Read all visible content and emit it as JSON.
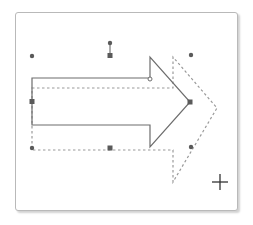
{
  "canvas": {
    "description": "Arrow shape being dragged with selection handles",
    "colors": {
      "frame_border": "#b9b9b9",
      "shape_stroke": "#6d6d6d",
      "preview_stroke": "#9a9a9a",
      "handle_fill": "#5a5a5a",
      "cursor": "#333333"
    }
  },
  "shape": {
    "type": "right-arrow",
    "state": "selected"
  },
  "preview": {
    "type": "right-arrow",
    "style": "dashed"
  },
  "handles": {
    "corner_dots": [
      "top-left",
      "top-right",
      "bottom-left",
      "bottom-right"
    ],
    "side_squares": [
      "top",
      "left",
      "right",
      "bottom"
    ],
    "rotation": "rotate-handle",
    "adjust": "head-adjust-handle"
  },
  "cursor": {
    "type": "crosshair",
    "glyph": "+"
  }
}
